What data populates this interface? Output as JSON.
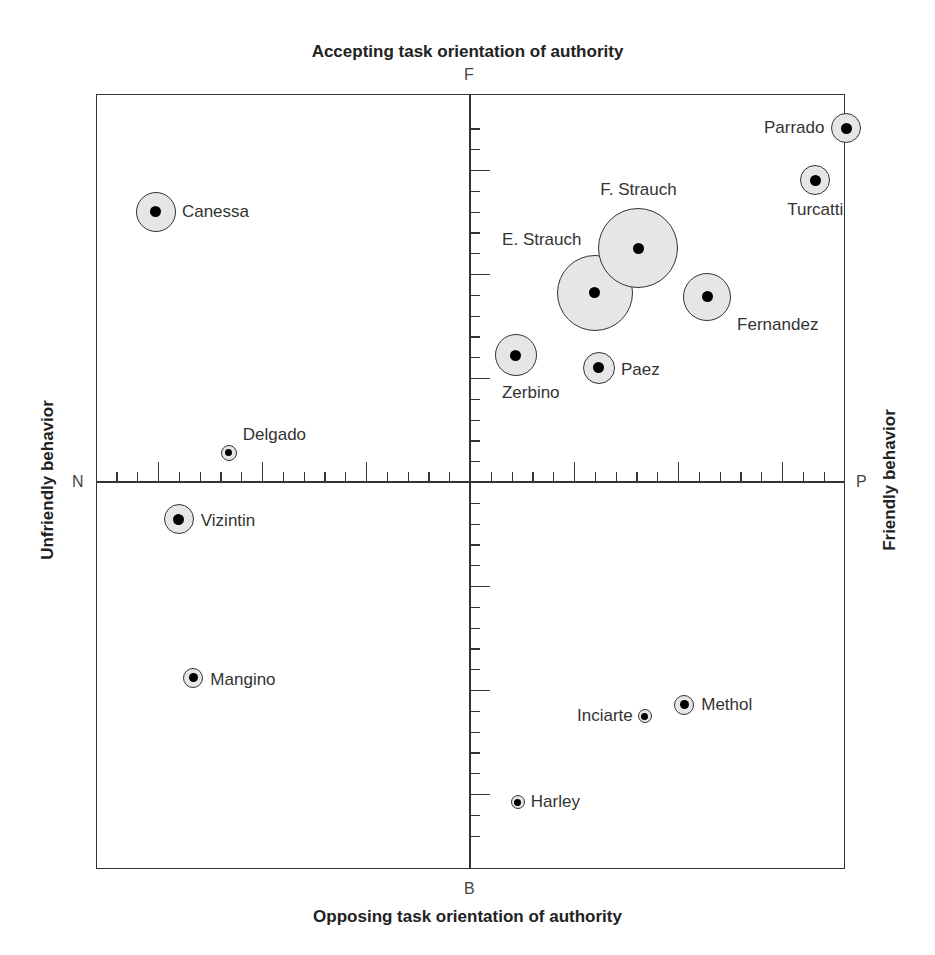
{
  "chart_data": {
    "type": "scatter",
    "title_top": "Accepting task orientation of authority",
    "title_bottom": "Opposing task orientation of authority",
    "title_left": "Unfriendly behavior",
    "title_right": "Friendly behavior",
    "poles": {
      "top": "F",
      "bottom": "B",
      "left": "N",
      "right": "P"
    },
    "xlim": [
      -18,
      18
    ],
    "ylim": [
      -18.6,
      18.6
    ],
    "grid": false,
    "major_tick_every": 5,
    "point_fill": "#e6e6e6",
    "point_stroke": "#333333",
    "points": [
      {
        "name": "Canessa",
        "x": -15.1,
        "y": 13.0,
        "r": 20,
        "label_dx": 26,
        "label_dy": 0,
        "align": "left"
      },
      {
        "name": "Parrado",
        "x": 18.1,
        "y": 17.0,
        "r": 15,
        "label_dx": -22,
        "label_dy": 0,
        "align": "right"
      },
      {
        "name": "Turcatti",
        "x": 16.6,
        "y": 14.5,
        "r": 15,
        "label_dx": 0,
        "label_dy": 30,
        "align": "center"
      },
      {
        "name": "E. Strauch",
        "x": 6.0,
        "y": 9.1,
        "r": 38,
        "label_dx": -53,
        "label_dy": -53,
        "align": "center"
      },
      {
        "name": "F. Strauch",
        "x": 8.1,
        "y": 11.25,
        "r": 40,
        "label_dx": 0,
        "label_dy": -58,
        "align": "center"
      },
      {
        "name": "Fernandez",
        "x": 11.4,
        "y": 8.9,
        "r": 24,
        "label_dx": 24,
        "label_dy": 28,
        "align": "left"
      },
      {
        "name": "Zerbino",
        "x": 2.2,
        "y": 6.1,
        "r": 21,
        "label_dx": 15,
        "label_dy": 38,
        "align": "center"
      },
      {
        "name": "Paez",
        "x": 6.2,
        "y": 5.5,
        "r": 16,
        "label_dx": 22,
        "label_dy": 2,
        "align": "left"
      },
      {
        "name": "Delgado",
        "x": -11.6,
        "y": 1.4,
        "r": 8,
        "label_dx": 12,
        "label_dy": -18,
        "align": "left"
      },
      {
        "name": "Vizintin",
        "x": -14.0,
        "y": -1.8,
        "r": 15,
        "label_dx": 22,
        "label_dy": 2,
        "align": "left"
      },
      {
        "name": "Mangino",
        "x": -13.3,
        "y": -9.4,
        "r": 10,
        "label_dx": 17,
        "label_dy": 2,
        "align": "left"
      },
      {
        "name": "Methol",
        "x": 10.3,
        "y": -10.7,
        "r": 10,
        "label_dx": 17,
        "label_dy": 0,
        "align": "left"
      },
      {
        "name": "Inciarte",
        "x": 8.4,
        "y": -11.25,
        "r": 7,
        "label_dx": -12,
        "label_dy": 0,
        "align": "right"
      },
      {
        "name": "Harley",
        "x": 2.3,
        "y": -15.4,
        "r": 7,
        "label_dx": 13,
        "label_dy": 0,
        "align": "left"
      }
    ]
  }
}
